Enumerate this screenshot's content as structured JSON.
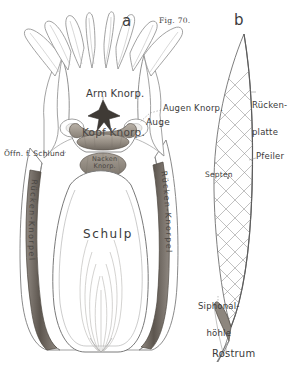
{
  "figure": {
    "caption": "Fig. 70.",
    "panel_a_id": "a",
    "panel_b_id": "b"
  },
  "labels": {
    "arm_knorpel": "Arm Knorp.",
    "kopf_knorpel": "Kopf Knorp.",
    "nacken_knorpel": "Nacken\nKnorp.",
    "auge": "Auge",
    "augen_knorpel": "Augen Knorp.",
    "offnung_schlund": "Öffn. f. Schlund",
    "schulp": "Schulp",
    "ruecken_knorpel_left": "Rücken-Knorpel",
    "ruecken_knorpel_right": "Rücken-Knorpel",
    "rueckenplatte": "Rücken-\nplatte",
    "rueckenplatte_line1": "Rücken-",
    "rueckenplatte_line2": "platte",
    "pfeiler": "Pfeiler",
    "septen": "Septen",
    "siphonalhoehle": "Siphonal-\nhöhle",
    "siphonalhoehle_line1": "Siphonal-",
    "siphonalhoehle_line2": "höhle",
    "rostrum": "Rostrum"
  },
  "colors": {
    "background": "#ffffff",
    "ink": "#3a3a3a",
    "outline": "#6b6b6b",
    "light_outline": "#9a9a9a",
    "cartilage_dark": "#5c5650",
    "cartilage_mid": "#8c857c",
    "cartilage_light": "#b5ada3",
    "hatch": "#8d8d8d"
  },
  "structure": {
    "panel_a_description": "Dorsal view of cuttlefish body with arms, head cartilages, eyes and internal shell (Schulp)",
    "panel_b_description": "Cuttlebone blade with cross-hatched lattice, dorsal plate, pillars, septa, siphonal cavity and rostrum",
    "arm_count": 8
  }
}
